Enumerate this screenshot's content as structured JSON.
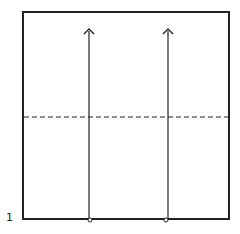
{
  "diagram": {
    "type": "folding-instruction",
    "step_number": "1",
    "frame": {
      "x": 23,
      "y": 12,
      "width": 206,
      "height": 207,
      "stroke": "#222222"
    },
    "fold_line": {
      "style": "dashed",
      "y": 117,
      "stroke": "#222222"
    },
    "arrows": [
      {
        "name": "left-arrow",
        "x": 89,
        "y_start": 219,
        "y_end": 30
      },
      {
        "name": "right-arrow",
        "x": 168,
        "y_start": 219,
        "y_end": 30
      }
    ],
    "colors": {
      "line": "#222222",
      "background": "#ffffff"
    }
  }
}
